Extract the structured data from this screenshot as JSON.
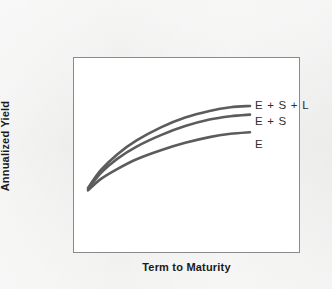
{
  "chart_data": {
    "type": "line",
    "title": "",
    "subtitle": "",
    "xlabel": "Term to Maturity",
    "ylabel": "Annualized Yield",
    "xticklabels": [],
    "yticklabels": [],
    "grid": false,
    "legend_position": "right-of-curve-ends",
    "axis_note": "Schematic yield curves — qualitative axes with no numeric tick labels",
    "line_color": "#5c5c5c",
    "plot_background": "#ffffff",
    "figure_background": "#ededec",
    "series": [
      {
        "name": "E + S + L",
        "label": "E + S + L",
        "color": "#5c5c5c",
        "x": [
          0.0,
          0.08,
          0.18,
          0.3,
          0.45,
          0.6,
          0.75,
          0.88,
          1.0
        ],
        "y": [
          0.0,
          0.22,
          0.41,
          0.58,
          0.74,
          0.86,
          0.94,
          0.985,
          1.0
        ]
      },
      {
        "name": "E + S",
        "label": "E + S",
        "color": "#5c5c5c",
        "x": [
          0.0,
          0.08,
          0.18,
          0.3,
          0.45,
          0.6,
          0.75,
          0.88,
          1.0
        ],
        "y": [
          0.0,
          0.2,
          0.37,
          0.52,
          0.66,
          0.77,
          0.85,
          0.89,
          0.91
        ]
      },
      {
        "name": "E",
        "label": "E",
        "color": "#5c5c5c",
        "x": [
          0.0,
          0.08,
          0.18,
          0.3,
          0.45,
          0.6,
          0.75,
          0.88,
          1.0
        ],
        "y": [
          0.0,
          0.14,
          0.26,
          0.38,
          0.49,
          0.58,
          0.65,
          0.69,
          0.71
        ]
      }
    ]
  },
  "figure": {
    "ylabel": "Annualized Yield",
    "xlabel": "Term to Maturity",
    "labels": {
      "esl": "E + S + L",
      "es": "E + S",
      "e": "E"
    }
  }
}
